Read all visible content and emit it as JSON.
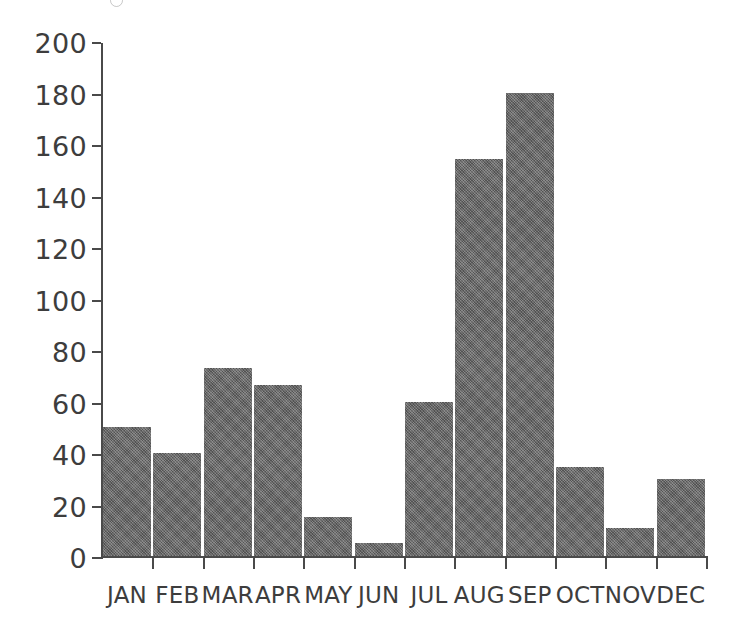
{
  "chart_data": {
    "type": "bar",
    "title": "",
    "subtitle": "",
    "xlabel": "",
    "ylabel": "",
    "categories": [
      "JAN",
      "FEB",
      "MAR",
      "APR",
      "MAY",
      "JUN",
      "JUL",
      "AUG",
      "SEP",
      "OCT",
      "NOV",
      "DEC"
    ],
    "values": [
      50,
      40,
      73,
      66.5,
      15,
      5,
      60,
      154,
      180,
      34.5,
      11,
      30
    ],
    "ylim": [
      0,
      200
    ],
    "xlim_categories": 12,
    "y_ticks": [
      0,
      20,
      40,
      60,
      80,
      100,
      120,
      140,
      160,
      180,
      200
    ],
    "y_tick_labels": [
      "0",
      "20",
      "40",
      "60",
      "80",
      "100",
      "120",
      "140",
      "160",
      "180",
      "200"
    ],
    "grid": false,
    "legend": null,
    "legend_position": "none",
    "annotations": [],
    "series": [
      {
        "name": "",
        "values": [
          50,
          40,
          73,
          66.5,
          15,
          5,
          60,
          154,
          180,
          34.5,
          11,
          30
        ]
      }
    ],
    "colors": {
      "bar_fill": "#636363",
      "axis": "#4a4a4a",
      "text": "#3d3d3d",
      "background": "#ffffff"
    }
  }
}
